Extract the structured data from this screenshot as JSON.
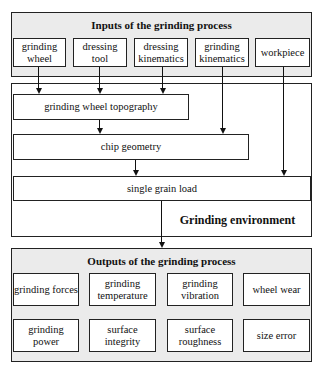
{
  "inputs": {
    "title": "Inputs of the grinding process",
    "items": [
      {
        "label": "grinding\nwheel"
      },
      {
        "label": "dressing\ntool"
      },
      {
        "label": "dressing\nkinematics"
      },
      {
        "label": "grinding\nkinematics"
      },
      {
        "label": "workpiece"
      }
    ]
  },
  "environment": {
    "label": "Grinding environment",
    "stages": [
      {
        "label": "grinding wheel topography"
      },
      {
        "label": "chip geometry"
      },
      {
        "label": "single grain load"
      }
    ]
  },
  "outputs": {
    "title": "Outputs of the grinding process",
    "items": [
      {
        "label": "grinding forces"
      },
      {
        "label": "grinding\ntemperature"
      },
      {
        "label": "grinding\nvibration"
      },
      {
        "label": "wheel wear"
      },
      {
        "label": "grinding power"
      },
      {
        "label": "surface\nintegrity"
      },
      {
        "label": "surface\nroughness"
      },
      {
        "label": "size error"
      }
    ]
  },
  "colors": {
    "line": "#222222",
    "group_fill": "#ebebeb",
    "box_fill": "#ffffff"
  }
}
